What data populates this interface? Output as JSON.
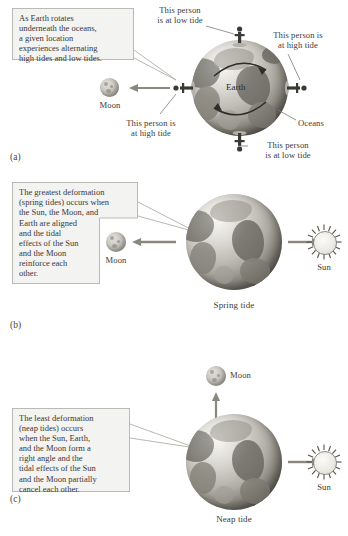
{
  "figure": {
    "panels": [
      {
        "letter": "(a)",
        "callout": "As Earth rotates\nunderneath the oceans,\na given location\nexperiences alternating\nhigh tides and low tides.",
        "body_labels": {
          "earth": "Earth",
          "moon": "Moon",
          "oceans": "Oceans"
        },
        "annotations": [
          "This person\nis at low tide",
          "This person is\nat high tide",
          "This person is\nat high tide",
          "This person\nis at low tide"
        ]
      },
      {
        "letter": "(b)",
        "callout_top": "The greatest deformation\n(spring tides) occurs when\nthe Sun, the Moon, and",
        "callout_bottom": "Earth are aligned\nand the tidal\neffects of the Sun\nand the Moon\nreinforce each\nother.",
        "body_labels": {
          "moon": "Moon",
          "sun": "Sun",
          "caption": "Spring tide"
        }
      },
      {
        "letter": "(c)",
        "callout": "The least deformation\n(neap tides) occurs\nwhen the Sun, Earth,\nand the Moon form a\nright angle and the\ntidal effects of the Sun\nand the Moon partially\ncancel each other.",
        "body_labels": {
          "moon": "Moon",
          "sun": "Sun",
          "caption": "Neap tide"
        }
      }
    ]
  },
  "colors": {
    "callout_fill": "#f3f3f1",
    "callout_border": "#b9b9b5",
    "text": "#3a3836",
    "arrow": "#8a8780",
    "earth_dark": "#6e6b64",
    "earth_light": "#dedcd6"
  }
}
